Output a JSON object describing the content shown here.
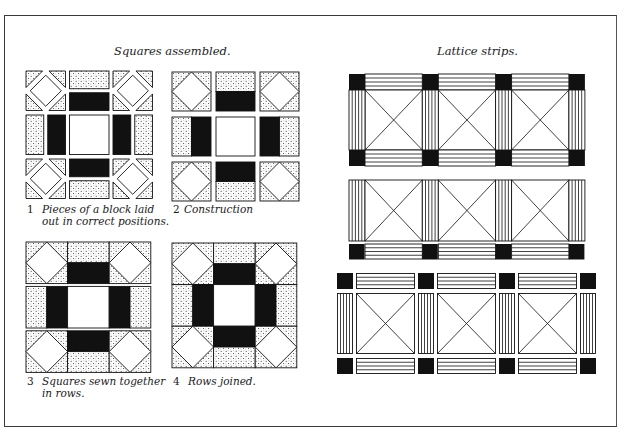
{
  "colors": {
    "ink": "#111111",
    "paper": "#ffffff",
    "frame": "#3a3a3a",
    "dot": "#222222"
  },
  "sections": {
    "left": {
      "title": "Squares assembled.",
      "figures": [
        {
          "number": "1",
          "caption_line1": "Pieces of a block laid",
          "caption_line2": "out in correct positions."
        },
        {
          "number": "2",
          "caption_line1": "Construction",
          "caption_line2": ""
        },
        {
          "number": "3",
          "caption_line1": "Squares sewn together",
          "caption_line2": "in rows."
        },
        {
          "number": "4",
          "caption_line1": "Rows joined.",
          "caption_line2": ""
        }
      ]
    },
    "right": {
      "title": "Lattice strips.",
      "strips": [
        {
          "name": "lattice-strip-joined-top-and-bottom",
          "blocks": 3,
          "sashing_top": true,
          "sashing_bottom": true,
          "exploded": false
        },
        {
          "name": "lattice-strip-sashing-bottom-only",
          "blocks": 3,
          "sashing_top": false,
          "sashing_bottom": true,
          "exploded": false
        },
        {
          "name": "lattice-strip-exploded",
          "blocks": 3,
          "sashing_top": true,
          "sashing_bottom": true,
          "exploded": true
        }
      ]
    }
  },
  "block_pattern": {
    "description": "9-patch: corner units = square-in-square (white diamond, dotted corner triangles); edge units = dotted + black half rectangles; center = white square",
    "grid": [
      [
        "corner",
        "edge-top",
        "corner"
      ],
      [
        "edge-left",
        "center",
        "edge-right"
      ],
      [
        "corner",
        "edge-bottom",
        "corner"
      ]
    ]
  }
}
